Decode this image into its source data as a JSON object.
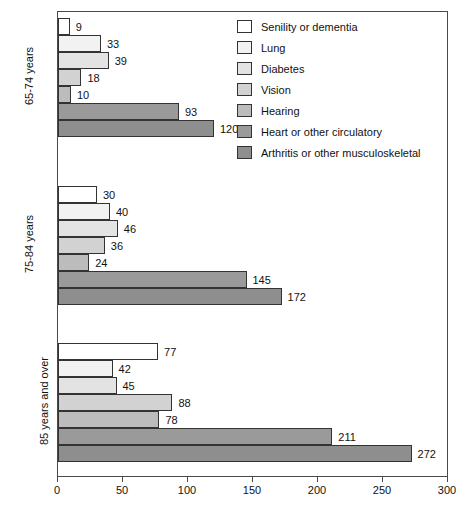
{
  "chart_data": {
    "type": "bar",
    "orientation": "horizontal",
    "title": "",
    "xlabel": "",
    "ylabel": "",
    "xlim": [
      0,
      300
    ],
    "xticks": [
      0,
      50,
      100,
      150,
      200,
      250,
      300
    ],
    "xtick_labels": [
      "0",
      "50",
      "100",
      "150",
      "200",
      "250",
      "300"
    ],
    "grid": false,
    "legend_position": "top-right",
    "categories": [
      "65-74 years",
      "75-84 years",
      "85 years and over"
    ],
    "series": [
      {
        "name": "Senility or dementia",
        "color": "#ffffff",
        "values": [
          9,
          30,
          77
        ]
      },
      {
        "name": "Lung",
        "color": "#f2f2f2",
        "values": [
          33,
          40,
          42
        ]
      },
      {
        "name": "Diabetes",
        "color": "#e3e3e3",
        "values": [
          39,
          46,
          45
        ]
      },
      {
        "name": "Vision",
        "color": "#d2d2d2",
        "values": [
          18,
          36,
          88
        ]
      },
      {
        "name": "Hearing",
        "color": "#bcbcbc",
        "values": [
          10,
          24,
          78
        ]
      },
      {
        "name": "Heart or other circulatory",
        "color": "#9a9a9a",
        "values": [
          93,
          145,
          211
        ]
      },
      {
        "name": "Arthritis or other musculoskeletal",
        "color": "#8e8e8e",
        "values": [
          120,
          172,
          272
        ]
      }
    ]
  },
  "legend": {
    "items": [
      {
        "label": "Senility or dementia",
        "color": "#ffffff"
      },
      {
        "label": "Lung",
        "color": "#f2f2f2"
      },
      {
        "label": "Diabetes",
        "color": "#e3e3e3"
      },
      {
        "label": "Vision",
        "color": "#d2d2d2"
      },
      {
        "label": "Hearing",
        "color": "#bcbcbc"
      },
      {
        "label": "Heart or other circulatory",
        "color": "#9a9a9a"
      },
      {
        "label": "Arthritis or other musculoskeletal",
        "color": "#8e8e8e"
      }
    ]
  },
  "axis": {
    "x_tick_labels": [
      "0",
      "50",
      "100",
      "150",
      "200",
      "250",
      "300"
    ],
    "group_labels": [
      "65-74 years",
      "75-84 years",
      "85 years and over"
    ]
  }
}
